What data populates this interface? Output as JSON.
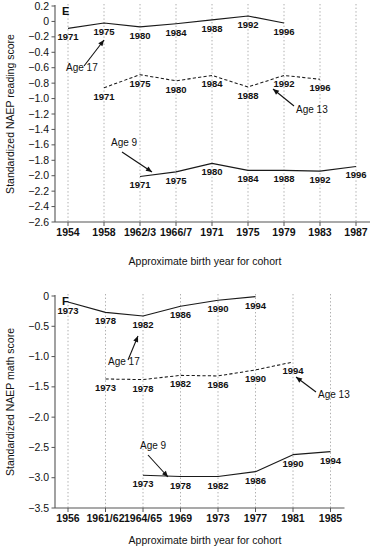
{
  "figure": {
    "panels": [
      "E",
      "F"
    ]
  },
  "chart_data": [
    {
      "id": "E",
      "panel_letter": "E",
      "type": "line",
      "title": "",
      "xlabel": "Approximate birth year for cohort",
      "ylabel": "Standardized NAEP reading score",
      "ylim": [
        -2.6,
        0.2
      ],
      "ytick_labels": [
        "0.2",
        "0",
        "−0.2",
        "−0.4",
        "−0.6",
        "−0.8",
        "−1.0",
        "−1.2",
        "−1.4",
        "−1.6",
        "−1.8",
        "−2.0",
        "−2.2",
        "−2.4",
        "−2.6"
      ],
      "ytick_values": [
        0.2,
        0,
        -0.2,
        -0.4,
        -0.6,
        -0.8,
        -1.0,
        -1.2,
        -1.4,
        -1.6,
        -1.8,
        -2.0,
        -2.2,
        -2.4,
        -2.6
      ],
      "xtick_labels": [
        "1954",
        "1958",
        "1962/3",
        "1966/7",
        "1971",
        "1975",
        "1979",
        "1983",
        "1987"
      ],
      "xtick_index": [
        0,
        1,
        2,
        3,
        4,
        5,
        6,
        7,
        8
      ],
      "grid": "vertical-dotted",
      "legend": "inline-annotations",
      "series": [
        {
          "name": "Age 17",
          "style": "solid",
          "label_position": "below",
          "annotation": "Age 17",
          "x_index": [
            0,
            1,
            2,
            3,
            4,
            5,
            6
          ],
          "point_labels": [
            "1971",
            "1975",
            "1980",
            "1984",
            "1988",
            "1992",
            "1996"
          ],
          "values": [
            -0.09,
            -0.02,
            -0.07,
            -0.03,
            0.02,
            0.07,
            -0.02
          ]
        },
        {
          "name": "Age 13",
          "style": "dashed",
          "label_position": "mixed",
          "annotation": "Age 13",
          "x_index": [
            1,
            2,
            3,
            4,
            5,
            6,
            7
          ],
          "point_labels": [
            "1971",
            "1975",
            "1980",
            "1984",
            "1988",
            "1992",
            "1996"
          ],
          "values": [
            -0.86,
            -0.69,
            -0.77,
            -0.7,
            -0.85,
            -0.7,
            -0.75
          ]
        },
        {
          "name": "Age 9",
          "style": "solid",
          "label_position": "below",
          "annotation": "Age 9",
          "x_index": [
            2,
            3,
            4,
            5,
            6,
            7,
            8
          ],
          "point_labels": [
            "1971",
            "1975",
            "1980",
            "1984",
            "1988",
            "1992",
            "1996"
          ],
          "values": [
            -2.01,
            -1.95,
            -1.84,
            -1.93,
            -1.93,
            -1.94,
            -1.88
          ]
        }
      ]
    },
    {
      "id": "F",
      "panel_letter": "F",
      "type": "line",
      "title": "",
      "xlabel": "Approximate birth year for cohort",
      "ylabel": "Standardized NAEP math score",
      "ylim": [
        -3.5,
        0
      ],
      "ytick_labels": [
        "0",
        "−0.5",
        "−1.0",
        "−1.5",
        "−2.0",
        "−2.5",
        "−3.0",
        "−3.5"
      ],
      "ytick_values": [
        0,
        -0.5,
        -1.0,
        -1.5,
        -2.0,
        -2.5,
        -3.0,
        -3.5
      ],
      "xtick_labels": [
        "1956",
        "1961/62",
        "1964/65",
        "1969",
        "1973",
        "1977",
        "1981",
        "1985"
      ],
      "xtick_index": [
        0,
        1,
        2,
        3,
        4,
        5,
        6,
        7
      ],
      "grid": "vertical-dotted",
      "legend": "inline-annotations",
      "series": [
        {
          "name": "Age 17",
          "style": "solid",
          "label_position": "below",
          "annotation": "Age 17",
          "x_index": [
            0,
            1,
            2,
            3,
            4,
            5
          ],
          "point_labels": [
            "1973",
            "1978",
            "1982",
            "1986",
            "1990",
            "1994"
          ],
          "values": [
            -0.1,
            -0.27,
            -0.33,
            -0.17,
            -0.07,
            -0.01
          ]
        },
        {
          "name": "Age 13",
          "style": "dashed",
          "label_position": "below",
          "annotation": "Age 13",
          "x_index": [
            1,
            2,
            3,
            4,
            5,
            6
          ],
          "point_labels": [
            "1973",
            "1978",
            "1982",
            "1986",
            "1990",
            "1994"
          ],
          "values": [
            -1.37,
            -1.38,
            -1.31,
            -1.32,
            -1.22,
            -1.09
          ]
        },
        {
          "name": "Age 9",
          "style": "solid",
          "label_position": "below",
          "annotation": "Age 9",
          "x_index": [
            2,
            3,
            4,
            5,
            6,
            7
          ],
          "point_labels": [
            "1973",
            "1978",
            "1982",
            "1986",
            "1990",
            "1994"
          ],
          "values": [
            -2.96,
            -2.98,
            -2.98,
            -2.9,
            -2.62,
            -2.57
          ]
        }
      ]
    }
  ]
}
